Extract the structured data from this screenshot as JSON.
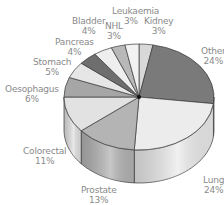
{
  "chart_data": {
    "type": "pie",
    "style": "3d-cylinder",
    "title": "",
    "start_angle_deg_from_top_clockwise": 0,
    "slices": [
      {
        "label": "Kidney",
        "value": 3,
        "value_label": "3%",
        "color": "#d8d8d8"
      },
      {
        "label": "Other",
        "value": 24,
        "value_label": "24%",
        "color": "#7a7a7a"
      },
      {
        "label": "Lung",
        "value": 24,
        "value_label": "24%",
        "color": "#ececec"
      },
      {
        "label": "Prostate",
        "value": 13,
        "value_label": "13%",
        "color": "#b4b4b4"
      },
      {
        "label": "Colorectal",
        "value": 11,
        "value_label": "11%",
        "color": "#e2e2e2"
      },
      {
        "label": "Oesophagus",
        "value": 6,
        "value_label": "6%",
        "color": "#a6a6a6"
      },
      {
        "label": "Stomach",
        "value": 5,
        "value_label": "5%",
        "color": "#e6e6e6"
      },
      {
        "label": "Pancreas",
        "value": 4,
        "value_label": "4%",
        "color": "#6e6e6e"
      },
      {
        "label": "Bladder",
        "value": 4,
        "value_label": "4%",
        "color": "#eeeeee"
      },
      {
        "label": "NHL",
        "value": 3,
        "value_label": "3%",
        "color": "#b8b8b8"
      },
      {
        "label": "Leukaemia",
        "value": 3,
        "value_label": "3%",
        "color": "#f2f2f2"
      }
    ],
    "legend": "none (direct labels)"
  },
  "labels": {
    "kidney": {
      "name": "Kidney",
      "pct": "3%"
    },
    "other": {
      "name": "Other",
      "pct": "24%"
    },
    "lung": {
      "name": "Lung",
      "pct": "24%"
    },
    "prostate": {
      "name": "Prostate",
      "pct": "13%"
    },
    "colorectal": {
      "name": "Colorectal",
      "pct": "11%"
    },
    "oesophagus": {
      "name": "Oesophagus",
      "pct": "6%"
    },
    "stomach": {
      "name": "Stomach",
      "pct": "5%"
    },
    "pancreas": {
      "name": "Pancreas",
      "pct": "4%"
    },
    "bladder": {
      "name": "Bladder",
      "pct": "4%"
    },
    "nhl": {
      "name": "NHL",
      "pct": "3%"
    },
    "leukaemia": {
      "name": "Leukaemia",
      "pct": "3%"
    }
  }
}
